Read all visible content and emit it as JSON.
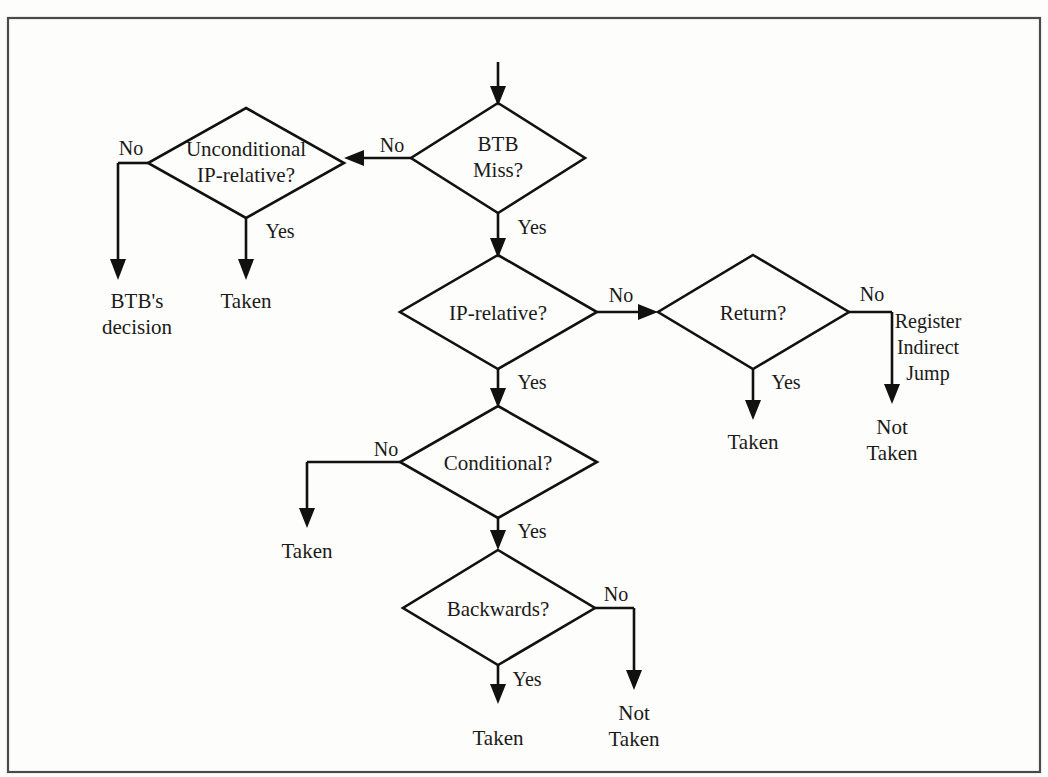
{
  "figure": {
    "background_color": "#fdfdfc",
    "line_color": "#111110",
    "text_color": "#1a1a18",
    "frame_color": "#4a4a4a"
  },
  "nodes": [
    {
      "id": "btb-miss",
      "label_line1": "BTB",
      "label_line2": "Miss?",
      "cx": 498,
      "cy": 158,
      "rx": 87,
      "ry": 55
    },
    {
      "id": "unconditional",
      "label_line1": "Unconditional",
      "label_line2": "IP-relative?",
      "cx": 246,
      "cy": 163,
      "rx": 98,
      "ry": 55
    },
    {
      "id": "ip-relative",
      "label_line1": "IP-relative?",
      "label_line2": "",
      "cx": 498,
      "cy": 312,
      "rx": 98,
      "ry": 57
    },
    {
      "id": "return",
      "label_line1": "Return?",
      "label_line2": "",
      "cx": 753,
      "cy": 312,
      "rx": 96,
      "ry": 57
    },
    {
      "id": "conditional",
      "label_line1": "Conditional?",
      "label_line2": "",
      "cx": 498,
      "cy": 462,
      "rx": 98,
      "ry": 56
    },
    {
      "id": "backwards",
      "label_line1": "Backwards?",
      "label_line2": "",
      "cx": 498,
      "cy": 607,
      "rx": 96,
      "ry": 58
    }
  ],
  "edge_labels": [
    {
      "id": "btb-miss-no",
      "text": "No",
      "x": 392,
      "y": 152
    },
    {
      "id": "btb-miss-yes",
      "text": "Yes",
      "x": 510,
      "y": 234
    },
    {
      "id": "uncond-no",
      "text": "No",
      "x": 131,
      "y": 155
    },
    {
      "id": "uncond-yes",
      "text": "Yes",
      "x": 257,
      "y": 238
    },
    {
      "id": "ip-relative-no",
      "text": "No",
      "x": 617,
      "y": 302
    },
    {
      "id": "ip-relative-yes",
      "text": "Yes",
      "x": 511,
      "y": 389
    },
    {
      "id": "return-yes",
      "text": "Yes",
      "x": 765,
      "y": 389
    },
    {
      "id": "return-no",
      "text": "No",
      "x": 871,
      "y": 301
    },
    {
      "id": "conditional-no",
      "text": "No",
      "x": 386,
      "y": 456
    },
    {
      "id": "conditional-yes",
      "text": "Yes",
      "x": 511,
      "y": 538
    },
    {
      "id": "backwards-no",
      "text": "No",
      "x": 606,
      "y": 601
    },
    {
      "id": "backwards-yes",
      "text": "Yes",
      "x": 508,
      "y": 686
    }
  ],
  "terminals": [
    {
      "id": "btb-decision",
      "line1": "BTB's",
      "line2": "decision",
      "x": 137,
      "y": 303
    },
    {
      "id": "taken-uncond",
      "line1": "Taken",
      "line2": "",
      "x": 246,
      "y": 303
    },
    {
      "id": "taken-return",
      "line1": "Taken",
      "line2": "",
      "x": 753,
      "y": 444
    },
    {
      "id": "not-taken-register",
      "line1": "Not",
      "line2": "Taken",
      "x": 892,
      "y": 429
    },
    {
      "id": "taken-conditional",
      "line1": "Taken",
      "line2": "",
      "x": 307,
      "y": 553
    },
    {
      "id": "taken-backwards",
      "line1": "Taken",
      "line2": "",
      "x": 498,
      "y": 740
    },
    {
      "id": "not-taken-backwards",
      "line1": "Not",
      "line2": "Taken",
      "x": 634,
      "y": 726
    }
  ],
  "notes": [
    {
      "id": "register-indirect-jump",
      "line1": "Register",
      "line2": "Indirect",
      "line3": "Jump",
      "x": 928,
      "y": 329
    }
  ],
  "entry_arrow": {
    "id": "entry-arrow",
    "x": 498,
    "y_start": 62,
    "y_end": 103
  }
}
